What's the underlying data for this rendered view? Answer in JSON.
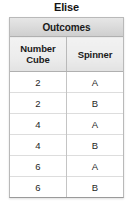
{
  "title": "Elise",
  "table": {
    "span_header": "Outcomes",
    "columns": [
      {
        "line1": "Number",
        "line2": "Cube"
      },
      {
        "line1": "Spinner",
        "line2": ""
      }
    ],
    "rows": [
      {
        "number_cube": "2",
        "spinner": "A"
      },
      {
        "number_cube": "2",
        "spinner": "B"
      },
      {
        "number_cube": "4",
        "spinner": "A"
      },
      {
        "number_cube": "4",
        "spinner": "B"
      },
      {
        "number_cube": "6",
        "spinner": "A"
      },
      {
        "number_cube": "6",
        "spinner": "B"
      }
    ]
  },
  "colors": {
    "header_band": "#dcdcdc",
    "column_header": "#ececec",
    "border": "#b9b9b9",
    "text": "#1a1a1a",
    "cell_background": "#ffffff"
  }
}
